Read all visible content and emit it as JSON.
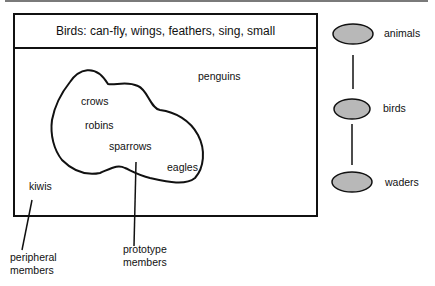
{
  "category": {
    "header": "Birds: can-fly, wings, feathers, sing, small",
    "members": {
      "penguins": "penguins",
      "crows": "crows",
      "robins": "robins",
      "sparrows": "sparrows",
      "eagles": "eagles",
      "kiwis": "kiwis"
    }
  },
  "annotations": {
    "peripheral": [
      "peripheral",
      "members"
    ],
    "prototype": [
      "prototype",
      "members"
    ]
  },
  "hierarchy": {
    "nodes": [
      {
        "label": "animals"
      },
      {
        "label": "birds"
      },
      {
        "label": "waders"
      }
    ],
    "node_fill": "#b8b8b8"
  }
}
